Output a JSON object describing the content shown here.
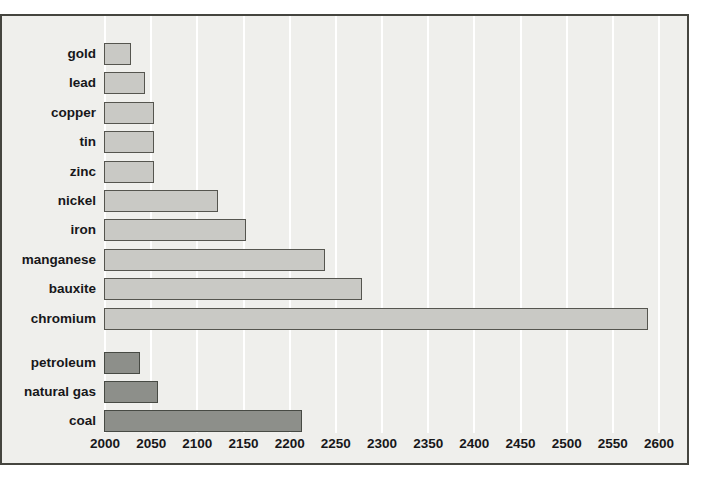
{
  "chart_data": {
    "type": "bar",
    "orientation": "horizontal",
    "title": "",
    "xlabel": "",
    "ylabel": "",
    "grid": true,
    "legend": false,
    "x_axis": {
      "min": 2000,
      "max": 2600,
      "tick_step": 50,
      "tick_labels": [
        "2000",
        "2050",
        "2100",
        "2150",
        "2200",
        "2250",
        "2300",
        "2350",
        "2400",
        "2450",
        "2500",
        "2550",
        "2600"
      ]
    },
    "groups": [
      {
        "name": "metals",
        "bar_fill_color": "#c9c9c5",
        "bar_border_color": "#55554f",
        "items": [
          {
            "label": "gold",
            "value": 2030
          },
          {
            "label": "lead",
            "value": 2045
          },
          {
            "label": "copper",
            "value": 2055
          },
          {
            "label": "tin",
            "value": 2055
          },
          {
            "label": "zinc",
            "value": 2055
          },
          {
            "label": "nickel",
            "value": 2125
          },
          {
            "label": "iron",
            "value": 2155
          },
          {
            "label": "manganese",
            "value": 2240
          },
          {
            "label": "bauxite",
            "value": 2280
          },
          {
            "label": "chromium",
            "value": 2590
          }
        ]
      },
      {
        "name": "fossil-fuels",
        "bar_fill_color": "#8d8f8a",
        "bar_border_color": "#474a44",
        "items": [
          {
            "label": "petroleum",
            "value": 2040
          },
          {
            "label": "natural gas",
            "value": 2060
          },
          {
            "label": "coal",
            "value": 2215
          }
        ]
      }
    ],
    "colors": {
      "panel_background": "#efefec",
      "gridline": "#ffffff",
      "frame_border": "#45453f",
      "text": "#17171a",
      "page_background": "#ffffff"
    }
  }
}
